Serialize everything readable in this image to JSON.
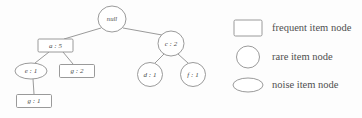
{
  "diagram": {
    "background_color": "#fdfdfd",
    "stroke_color": "#8e8e8e",
    "text_color": "#4a4a4a",
    "nodes": [
      {
        "id": "root",
        "label": "null",
        "shape": "circle",
        "cx": 112,
        "cy": 19,
        "rx": 14,
        "ry": 13
      },
      {
        "id": "a5",
        "label": "a : 5",
        "shape": "rectangle",
        "cx": 55.5,
        "cy": 45.5,
        "rx": 17.5,
        "ry": 6.5
      },
      {
        "id": "c2",
        "label": "c : 2",
        "shape": "circle",
        "cx": 171,
        "cy": 43.5,
        "rx": 13,
        "ry": 12.5
      },
      {
        "id": "e1",
        "label": "e : 1",
        "shape": "ellipse",
        "cx": 31,
        "cy": 71,
        "rx": 16,
        "ry": 8
      },
      {
        "id": "g2",
        "label": "g : 2",
        "shape": "rectangle",
        "cx": 77,
        "cy": 71,
        "rx": 17.5,
        "ry": 6.5
      },
      {
        "id": "d1",
        "label": "d : 1",
        "shape": "circle",
        "cx": 150,
        "cy": 74.5,
        "rx": 12.5,
        "ry": 12
      },
      {
        "id": "f1",
        "label": "f : 1",
        "shape": "circle",
        "cx": 193,
        "cy": 74.5,
        "rx": 12.5,
        "ry": 12
      },
      {
        "id": "g1",
        "label": "g : 1",
        "shape": "rectangle",
        "cx": 34,
        "cy": 101,
        "rx": 17.5,
        "ry": 6.5
      }
    ],
    "edges": [
      {
        "from": "root",
        "to": "a5",
        "x1": 101,
        "y1": 28,
        "x2": 64,
        "y2": 39
      },
      {
        "from": "root",
        "to": "c2",
        "x1": 123,
        "y1": 28,
        "x2": 162,
        "y2": 35
      },
      {
        "from": "a5",
        "to": "e1",
        "x1": 49,
        "y1": 52,
        "x2": 35,
        "y2": 63
      },
      {
        "from": "a5",
        "to": "g2",
        "x1": 63,
        "y1": 52,
        "x2": 73,
        "y2": 64
      },
      {
        "from": "c2",
        "to": "d1",
        "x1": 164,
        "y1": 54,
        "x2": 155,
        "y2": 63
      },
      {
        "from": "c2",
        "to": "f1",
        "x1": 178,
        "y1": 54,
        "x2": 188,
        "y2": 63
      },
      {
        "from": "e1",
        "to": "g1",
        "x1": 33,
        "y1": 79,
        "x2": 34,
        "y2": 94
      }
    ]
  },
  "legend": {
    "items": [
      {
        "shape": "rectangle",
        "label": "frequent item node",
        "cx": 248,
        "cy": 28,
        "rx": 14,
        "ry": 8
      },
      {
        "shape": "circle",
        "label": "rare item node",
        "cx": 248,
        "cy": 57,
        "rx": 11.5,
        "ry": 11
      },
      {
        "shape": "ellipse",
        "label": "noise item node",
        "cx": 248,
        "cy": 85,
        "rx": 15,
        "ry": 7
      }
    ],
    "text_x": 272
  }
}
